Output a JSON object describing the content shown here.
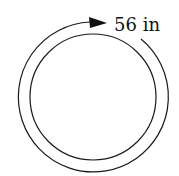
{
  "diagram": {
    "type": "circle-circumference",
    "label": "56 in",
    "colors": {
      "stroke": "#1a1a1a",
      "background": "#ffffff"
    }
  }
}
